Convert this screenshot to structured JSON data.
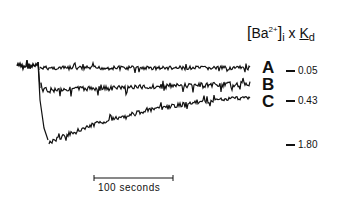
{
  "chart_data": {
    "type": "line",
    "title": "[Ba2+]i x Kd",
    "title_parts": {
      "open": "[",
      "ion": "Ba",
      "charge": "2+",
      "close": "]",
      "sub_i": "i",
      "times": "x",
      "k": "K",
      "sub_d": "d"
    },
    "xlabel": "",
    "ylabel": "[Ba2+]i x Kd",
    "scale_bar": {
      "label": "100 seconds",
      "length_seconds": 100
    },
    "series": [
      {
        "name": "A",
        "level": 0.05,
        "description": "small drop, stays near baseline"
      },
      {
        "name": "B",
        "level": null,
        "description": "intermediate drop, slow partial recovery"
      },
      {
        "name": "C",
        "level": 0.43,
        "description": "large drop to ~1.80 then slow recovery toward 0.43"
      }
    ],
    "y_ticks": [
      {
        "label": "0.05",
        "value": 0.05
      },
      {
        "label": "0.43",
        "value": 0.43
      },
      {
        "label": "1.80",
        "value": 1.8
      }
    ],
    "grid": false,
    "legend_position": "right"
  },
  "labels": {
    "a": "A",
    "b": "B",
    "c": "C"
  },
  "ticks": {
    "t1": "0.05",
    "t2": "0.43",
    "t3": "1.80"
  }
}
